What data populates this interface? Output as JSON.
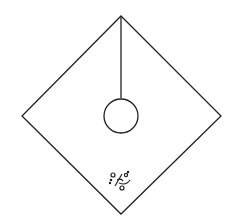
{
  "diagram": {
    "background": "#ffffff",
    "stroke_color": "#222222",
    "diamond": {
      "top": [
        121,
        16
      ],
      "right": [
        221,
        116
      ],
      "bottom": [
        121,
        214
      ],
      "left": [
        22,
        116
      ]
    },
    "pendulum_line": {
      "x1": 121,
      "y1": 16,
      "x2": 121,
      "y2": 98
    },
    "circle": {
      "cx": 121,
      "cy": 116,
      "r": 17
    },
    "scribble_mark": {
      "x": 110,
      "y": 172,
      "description": "small illegible handwritten mark"
    }
  }
}
